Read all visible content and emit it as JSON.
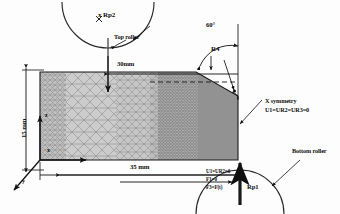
{
  "figure": {
    "kind": "finite-element-model-schematic"
  },
  "labels": {
    "rp2": "x Rp2",
    "top_roller": "Top roller",
    "bottom_roller": "Bottom roller",
    "rp1": "Rp1",
    "angle_60": "60°",
    "radius_r4": "R4",
    "dim_30mm": "30mm",
    "dim_35mm": "35 mm",
    "dim_15mm": "15 mm",
    "x_symmetry_title": "X symmetry",
    "x_symmetry_cond": "U1=UR2=UR3=0",
    "bc_line1": "U1=UR2=0",
    "bc_line2": "F1=0",
    "bc_line3": "F3=F(t)"
  },
  "axes": {
    "z": "z",
    "x": "x",
    "y": "y"
  },
  "colors": {
    "line": "#101010",
    "mesh_light": "#cfcfcf",
    "mesh_mid": "#b4b4b4",
    "mesh_dark": "#9a9a9a",
    "part_fill": "#c6c6c6",
    "background": "#fdfdfd"
  },
  "geometry": {
    "width_mm": 35,
    "height_mm": 15,
    "flat_top_mm": 30,
    "chamfer_angle_deg": 60,
    "fillet_radius_mm": 4
  }
}
